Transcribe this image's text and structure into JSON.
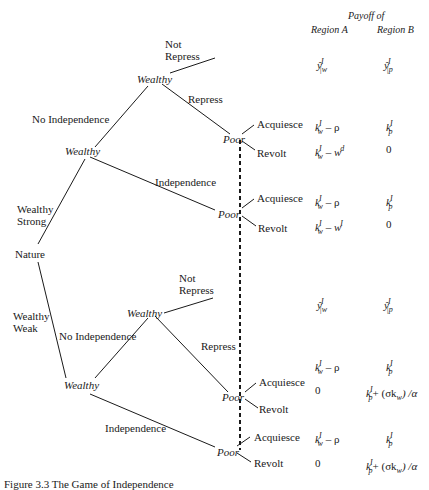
{
  "header": {
    "payoff_of": "Payoff of",
    "region_a": "Region A",
    "region_b": "Region B"
  },
  "nodes": {
    "nature": "Nature",
    "wealthy_strong_w1": "Wealthy",
    "wealthy_strong_w2": "Wealthy",
    "poor_strong_repress": "Poor",
    "poor_strong_indep": "Poor",
    "wealthy_weak_w1": "Wealthy",
    "wealthy_weak_w2": "Wealthy",
    "poor_weak_repress": "Poor",
    "poor_weak_indep": "Poor"
  },
  "branches": {
    "wealthy_strong_l1": "Wealthy",
    "wealthy_strong_l2": "Strong",
    "wealthy_weak_l1": "Wealthy",
    "wealthy_weak_l2": "Weak",
    "no_independence_top": "No Independence",
    "independence_top": "Independence",
    "not_repress_top_l1": "Not",
    "not_repress_top_l2": "Repress",
    "repress_top": "Repress",
    "no_independence_bottom": "No Independence",
    "independence_bottom": "Independence",
    "not_repress_bottom_l1": "Not",
    "not_repress_bottom_l2": "Repress",
    "repress_bottom": "Repress",
    "acquiesce": "Acquiesce",
    "revolt": "Revolt"
  },
  "payoffs": [
    {
      "outcome": "Strong / No Independence / Not Repress",
      "a": {
        "base": "ŷ",
        "sup": "I",
        "sub": "|w"
      },
      "b": {
        "base": "ŷ",
        "sup": "I",
        "sub": "|p"
      }
    },
    {
      "outcome": "Strong / Repress / Acquiesce",
      "a_text": "k",
      "a_sup": "I",
      "a_sub": "w",
      "a_tail": "– ρ",
      "b_text": "k",
      "b_sup": "I",
      "b_sub": "p"
    },
    {
      "outcome": "Strong / Repress / Revolt",
      "a_text": "k",
      "a_sup": "I",
      "a_sub": "w",
      "a_tail": "– w",
      "a_tail_sup": "d",
      "b_value": "0"
    },
    {
      "outcome": "Strong / Independence / Acquiesce",
      "a_text": "k",
      "a_sup": "I",
      "a_sub": "w",
      "a_tail": "– ρ",
      "b_text": "k",
      "b_sup": "I",
      "b_sub": "p"
    },
    {
      "outcome": "Strong / Independence / Revolt",
      "a_text": "k",
      "a_sup": "I",
      "a_sub": "w",
      "a_tail": "– w",
      "a_tail_sup": "I",
      "b_value": "0"
    },
    {
      "outcome": "Weak / No Independence / Not Repress",
      "a": {
        "base": "ŷ",
        "sup": "I",
        "sub": "|w"
      },
      "b": {
        "base": "ŷ",
        "sup": "I",
        "sub": "|p"
      }
    },
    {
      "outcome": "Weak / Repress / Acquiesce",
      "a_text": "k",
      "a_sup": "I",
      "a_sub": "w",
      "a_tail": "– ρ",
      "b_text": "k",
      "b_sup": "I",
      "b_sub": "p"
    },
    {
      "outcome": "Weak / Repress / Revolt",
      "a_value": "0",
      "b_text": "k",
      "b_sup": "I",
      "b_sub": "p",
      "b_tail": "+ (σk",
      "b_tail_sub": "w",
      "b_tail_end": ") /α"
    },
    {
      "outcome": "Weak / Independence / Acquiesce",
      "a_text": "k",
      "a_sup": "I",
      "a_sub": "w",
      "a_tail": "– ρ",
      "b_text": "k",
      "b_sup": "I",
      "b_sub": "p"
    },
    {
      "outcome": "Weak / Independence / Revolt",
      "a_value": "0",
      "b_text": "k",
      "b_sup": "I",
      "b_sub": "p",
      "b_tail": "+ (σk",
      "b_tail_sub": "w",
      "b_tail_end": ") /α"
    }
  ],
  "caption": "Figure 3.3  The Game of Independence"
}
